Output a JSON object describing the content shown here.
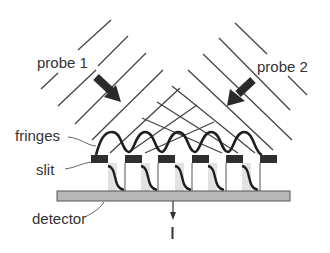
{
  "labels": {
    "probe1": "probe 1",
    "probe2": "probe 2",
    "fringes": "fringes",
    "slit": "slit",
    "detector": "detector",
    "intensity": "I"
  },
  "colors": {
    "line": "#333333",
    "slit": "#2f2f2f",
    "detector_fill": "#b8b8b8",
    "detector_stroke": "#555555",
    "shadow": "#dcdcdc"
  }
}
